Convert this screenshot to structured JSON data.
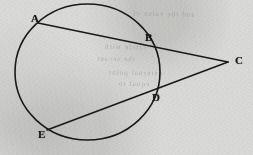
{
  "figure": {
    "background_color": "#d9d9d7",
    "ink_color": "#1a1a1c",
    "label_color": "#17171a",
    "width": 253,
    "height": 155,
    "circle": {
      "name": "circle",
      "center_x": 87.5,
      "center_y": 72,
      "radius_x": 72.5,
      "radius_y": 68,
      "stroke_width": 1.6
    },
    "points": [
      {
        "id": "A",
        "label": "A",
        "x": 38,
        "y": 23,
        "label_x": 31,
        "label_y": 13,
        "on_circle": true
      },
      {
        "id": "B",
        "label": "B",
        "x": 145,
        "y": 44,
        "label_x": 145,
        "label_y": 32,
        "on_circle": true
      },
      {
        "id": "C",
        "label": "C",
        "x": 228,
        "y": 62,
        "label_x": 235,
        "label_y": 55,
        "on_circle": false
      },
      {
        "id": "D",
        "label": "D",
        "x": 150,
        "y": 92,
        "label_x": 152,
        "label_y": 92,
        "on_circle": true
      },
      {
        "id": "E",
        "label": "E",
        "x": 47,
        "y": 130,
        "label_x": 38,
        "label_y": 129,
        "on_circle": true
      }
    ],
    "segments": [
      {
        "id": "ABC",
        "name": "secant-a-b-c",
        "from": "A",
        "to": "C",
        "through": "B",
        "stroke_width": 1.6
      },
      {
        "id": "EDC",
        "name": "secant-e-d-c",
        "from": "E",
        "to": "C",
        "through": "D",
        "stroke_width": 1.6
      }
    ],
    "ghost_text": [
      {
        "id": "g1",
        "text": "and the value of"
      },
      {
        "id": "g2",
        "text": "circle with"
      },
      {
        "id": "g3",
        "text": "the secant"
      },
      {
        "id": "g4",
        "text": "external point"
      },
      {
        "id": "g5",
        "text": "equal to"
      }
    ]
  }
}
